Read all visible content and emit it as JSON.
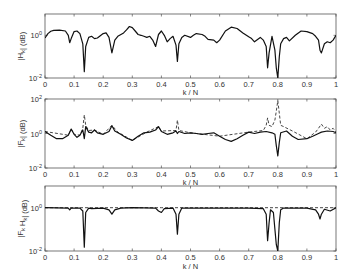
{
  "chart_data": [
    {
      "type": "line",
      "ylabel": "|H_k| (dB)",
      "xlabel": "k / N",
      "xlim": [
        0,
        1
      ],
      "ylim": [
        0.01,
        10
      ],
      "yscale": "log",
      "xticks": [
        "0",
        "0.1",
        "0.2",
        "0.3",
        "0.4",
        "0.5",
        "0.6",
        "0.7",
        "0.8",
        "0.9",
        "1"
      ],
      "yticks": [
        {
          "value": 1,
          "label": "10^0"
        },
        {
          "value": 0.01,
          "label": "10^-2"
        }
      ],
      "series": [
        {
          "name": "H_k",
          "style": "solid",
          "x": [
            0,
            0.01,
            0.02,
            0.03,
            0.05,
            0.07,
            0.08,
            0.085,
            0.09,
            0.1,
            0.11,
            0.12,
            0.13,
            0.135,
            0.14,
            0.15,
            0.16,
            0.17,
            0.18,
            0.2,
            0.21,
            0.22,
            0.23,
            0.24,
            0.25,
            0.27,
            0.28,
            0.29,
            0.3,
            0.31,
            0.32,
            0.33,
            0.34,
            0.35,
            0.36,
            0.37,
            0.38,
            0.39,
            0.4,
            0.41,
            0.42,
            0.43,
            0.44,
            0.45,
            0.455,
            0.46,
            0.47,
            0.48,
            0.5,
            0.51,
            0.52,
            0.54,
            0.55,
            0.56,
            0.58,
            0.59,
            0.6,
            0.62,
            0.64,
            0.66,
            0.68,
            0.7,
            0.71,
            0.72,
            0.74,
            0.75,
            0.76,
            0.765,
            0.77,
            0.78,
            0.79,
            0.795,
            0.8,
            0.805,
            0.81,
            0.82,
            0.83,
            0.84,
            0.86,
            0.88,
            0.9,
            0.92,
            0.93,
            0.94,
            0.945,
            0.95,
            0.96,
            0.97,
            0.98,
            0.99,
            1
          ],
          "values": [
            0.75,
            1.2,
            1.55,
            1.7,
            1.75,
            1.6,
            1.0,
            0.45,
            0.7,
            1.5,
            1.6,
            1.2,
            0.4,
            0.02,
            0.3,
            0.8,
            0.9,
            0.7,
            0.75,
            1.2,
            1.3,
            0.8,
            0.15,
            0.6,
            0.9,
            1.3,
            1.8,
            2.6,
            2.3,
            1.6,
            1.1,
            1.0,
            0.9,
            0.8,
            0.9,
            0.6,
            0.3,
            1.1,
            1.6,
            1.0,
            0.5,
            0.7,
            0.9,
            0.35,
            0.06,
            0.4,
            0.8,
            1.0,
            0.8,
            1.0,
            1.2,
            1.1,
            0.9,
            0.65,
            0.6,
            0.45,
            0.6,
            1.6,
            2.4,
            2.1,
            1.3,
            0.85,
            0.7,
            0.5,
            0.8,
            0.6,
            0.3,
            0.03,
            0.15,
            0.9,
            0.2,
            0.03,
            0.006,
            0.1,
            0.4,
            0.7,
            0.8,
            0.55,
            1.0,
            1.6,
            1.5,
            1.2,
            0.9,
            0.6,
            0.2,
            0.15,
            0.4,
            0.5,
            0.45,
            0.6,
            1.0
          ]
        }
      ]
    },
    {
      "type": "line",
      "ylabel": "|F_k| (dB)",
      "xlabel": "k / N",
      "xlim": [
        0,
        1
      ],
      "ylim": [
        0.01,
        100
      ],
      "yscale": "log",
      "xticks": [
        "0",
        "0.1",
        "0.2",
        "0.3",
        "0.4",
        "0.5",
        "0.6",
        "0.7",
        "0.8",
        "0.9",
        "1"
      ],
      "yticks": [
        {
          "value": 100,
          "label": "10^2"
        },
        {
          "value": 1,
          "label": "10^0"
        },
        {
          "value": 0.01,
          "label": "10^-2"
        }
      ],
      "series": [
        {
          "name": "F_k",
          "style": "solid",
          "x": [
            0,
            0.02,
            0.04,
            0.06,
            0.08,
            0.09,
            0.1,
            0.11,
            0.12,
            0.13,
            0.135,
            0.14,
            0.15,
            0.16,
            0.17,
            0.18,
            0.2,
            0.22,
            0.23,
            0.24,
            0.26,
            0.28,
            0.3,
            0.32,
            0.34,
            0.36,
            0.38,
            0.39,
            0.4,
            0.42,
            0.44,
            0.45,
            0.455,
            0.46,
            0.48,
            0.5,
            0.52,
            0.54,
            0.56,
            0.58,
            0.6,
            0.62,
            0.64,
            0.66,
            0.68,
            0.7,
            0.72,
            0.74,
            0.76,
            0.78,
            0.79,
            0.795,
            0.8,
            0.805,
            0.81,
            0.83,
            0.85,
            0.87,
            0.9,
            0.92,
            0.94,
            0.95,
            0.97,
            0.99,
            1
          ],
          "values": [
            1.3,
            0.8,
            0.5,
            0.5,
            0.8,
            1.8,
            0.9,
            0.6,
            0.8,
            1.6,
            0.5,
            2.5,
            1.2,
            1.1,
            1.6,
            1.1,
            0.9,
            1.3,
            2.8,
            1.4,
            0.9,
            0.55,
            0.4,
            0.7,
            1.1,
            1.2,
            1.6,
            2.5,
            1.3,
            0.9,
            1.1,
            1.4,
            1.0,
            1.3,
            1.0,
            1.1,
            1.0,
            0.9,
            1.0,
            1.1,
            0.7,
            0.45,
            0.35,
            0.5,
            0.8,
            1.2,
            1.0,
            1.2,
            1.3,
            1.1,
            0.9,
            0.2,
            0.05,
            0.3,
            1.1,
            1.4,
            0.7,
            0.45,
            0.5,
            0.7,
            1.0,
            1.2,
            1.4,
            1.3,
            1.1
          ]
        },
        {
          "name": "F_k (alt)",
          "style": "dashed",
          "x": [
            0,
            0.08,
            0.09,
            0.1,
            0.12,
            0.13,
            0.135,
            0.14,
            0.15,
            0.17,
            0.2,
            0.23,
            0.25,
            0.3,
            0.35,
            0.39,
            0.4,
            0.45,
            0.455,
            0.46,
            0.5,
            0.6,
            0.7,
            0.75,
            0.76,
            0.765,
            0.77,
            0.78,
            0.79,
            0.795,
            0.8,
            0.805,
            0.81,
            0.82,
            0.85,
            0.9,
            0.93,
            0.94,
            0.95,
            0.96,
            0.97,
            0.98,
            0.99,
            1
          ],
          "values": [
            1.3,
            0.8,
            1.8,
            0.9,
            0.8,
            2.0,
            12,
            3.0,
            1.5,
            1.6,
            0.9,
            3.0,
            1.2,
            0.4,
            1.2,
            2.5,
            1.4,
            1.5,
            6,
            1.5,
            1.1,
            0.7,
            1.2,
            1.5,
            3,
            8,
            3,
            2.5,
            6,
            20,
            80,
            15,
            3,
            2.5,
            1.4,
            0.5,
            1.2,
            2.0,
            3.5,
            2.0,
            2.5,
            1.6,
            2.0,
            1.2
          ]
        }
      ]
    },
    {
      "type": "line",
      "ylabel": "|F_k H_k| (dB)",
      "xlabel": "k / N",
      "xlim": [
        0,
        1
      ],
      "ylim": [
        0.01,
        10
      ],
      "yscale": "log",
      "xticks": [
        "0",
        "0.1",
        "0.2",
        "0.3",
        "0.4",
        "0.5",
        "0.6",
        "0.7",
        "0.8",
        "0.9",
        "1"
      ],
      "yticks": [
        {
          "value": 1,
          "label": "10^0"
        },
        {
          "value": 0.01,
          "label": "10^-2"
        }
      ],
      "series": [
        {
          "name": "F_k H_k",
          "style": "solid",
          "x": [
            0,
            0.08,
            0.085,
            0.09,
            0.12,
            0.13,
            0.135,
            0.14,
            0.15,
            0.16,
            0.2,
            0.22,
            0.23,
            0.24,
            0.26,
            0.3,
            0.38,
            0.39,
            0.4,
            0.41,
            0.44,
            0.45,
            0.455,
            0.46,
            0.47,
            0.5,
            0.55,
            0.6,
            0.7,
            0.75,
            0.76,
            0.765,
            0.77,
            0.775,
            0.785,
            0.79,
            0.795,
            0.8,
            0.805,
            0.81,
            0.82,
            0.85,
            0.9,
            0.93,
            0.94,
            0.945,
            0.95,
            0.96,
            0.98,
            1
          ],
          "values": [
            1.0,
            0.95,
            0.8,
            0.95,
            0.95,
            0.7,
            0.015,
            0.6,
            0.95,
            0.9,
            0.95,
            0.8,
            0.5,
            0.8,
            0.95,
            1.0,
            0.95,
            0.7,
            0.6,
            0.9,
            0.95,
            0.5,
            0.06,
            0.5,
            0.95,
            0.95,
            0.95,
            0.95,
            0.95,
            0.9,
            0.5,
            0.03,
            0.2,
            0.8,
            0.6,
            0.1,
            0.02,
            0.005,
            0.2,
            0.8,
            0.95,
            0.95,
            0.95,
            0.8,
            0.5,
            0.3,
            0.5,
            0.85,
            0.7,
            1.0
          ]
        },
        {
          "name": "F_k H_k (alt)",
          "style": "dashed",
          "x": [
            0,
            0.2,
            0.4,
            0.6,
            0.8,
            1
          ],
          "values": [
            1.0,
            1.0,
            1.0,
            1.0,
            1.0,
            1.0
          ]
        }
      ]
    }
  ]
}
